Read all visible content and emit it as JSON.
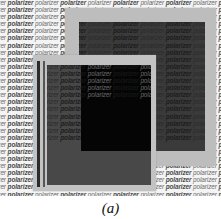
{
  "figure": {
    "background_word": "polarizer",
    "background_row_text": "izer polarizer polarizer polarizer polarizer polarizer polarizer polarizer polarizer",
    "background_rows": 28,
    "elements": [
      {
        "name": "back-polarizer",
        "description": "upper-right polarizer sheet with light frame"
      },
      {
        "name": "front-polarizer",
        "description": "lower-left polarizer sheet with light frame"
      },
      {
        "name": "overlap-region",
        "description": "crossed polarizers appear black"
      }
    ],
    "colors": {
      "background": "#f4f4f4",
      "frame": "#bdbdbd",
      "polarizer_inner": "#3a3a3a",
      "overlap": "#050505"
    }
  },
  "caption": "(a)"
}
